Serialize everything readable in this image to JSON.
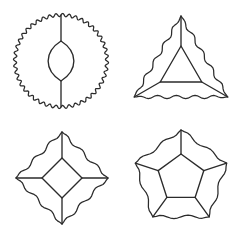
{
  "canvas": {
    "width": 240,
    "height": 235,
    "background": "#ffffff",
    "stroke_color": "#2b2b2b",
    "stroke_width": 1.35
  },
  "figure_set": {
    "title": "",
    "layout": "2x2-grid",
    "count": 4,
    "common_description": "Each figure has a scalloped (wavy) outer boundary, a smaller similar polygon inside, and straight spokes joining inner vertices to outer vertices."
  },
  "figures": [
    {
      "id": "figure-circle-lens",
      "name": "circle-with-lens",
      "position": "top-left",
      "outer_shape": "circle",
      "outer_sides": 2,
      "inner_shape": "lens",
      "inner_sides": 2,
      "spokes": 2,
      "center_x": 61,
      "center_y": 61,
      "outer_radius": 46,
      "inner_radius": 20,
      "rotation_deg": -90,
      "wavy_outer": true,
      "wave_count": 44,
      "wave_amplitude": 1.6,
      "label": ""
    },
    {
      "id": "figure-triangle",
      "name": "triangle-with-inner-triangle",
      "position": "top-right",
      "outer_shape": "triangle",
      "outer_sides": 3,
      "inner_shape": "triangle",
      "inner_sides": 3,
      "spokes": 3,
      "center_x": 181,
      "center_y": 70,
      "outer_radius": 54,
      "inner_radius": 24,
      "rotation_deg": -90,
      "wavy_outer": true,
      "wave_count": 15,
      "wave_amplitude": 1.7,
      "label": ""
    },
    {
      "id": "figure-square",
      "name": "square-with-inner-square",
      "position": "bottom-left",
      "outer_shape": "square",
      "outer_sides": 4,
      "inner_shape": "square",
      "inner_sides": 4,
      "spokes": 4,
      "center_x": 62,
      "center_y": 178,
      "outer_radius": 46,
      "inner_radius": 20,
      "rotation_deg": -90,
      "wavy_outer": true,
      "wave_count": 12,
      "wave_amplitude": 1.7,
      "label": ""
    },
    {
      "id": "figure-pentagon",
      "name": "pentagon-with-inner-pentagon",
      "position": "bottom-right",
      "outer_shape": "pentagon",
      "outer_sides": 5,
      "inner_shape": "pentagon",
      "inner_sides": 5,
      "spokes": 5,
      "center_x": 181,
      "center_y": 178,
      "outer_radius": 48,
      "inner_radius": 24,
      "rotation_deg": -90,
      "wavy_outer": true,
      "wave_count": 10,
      "wave_amplitude": 1.7,
      "label": ""
    }
  ]
}
